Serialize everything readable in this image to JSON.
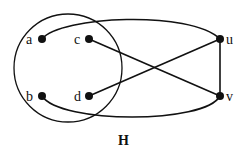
{
  "diagram": {
    "type": "graph",
    "title": "H",
    "colors": {
      "stroke": "#111111",
      "background": "#ffffff"
    },
    "subset_circle": {
      "contains": [
        "a",
        "b",
        "c",
        "d"
      ]
    },
    "vertices": [
      {
        "id": "a",
        "label": "a"
      },
      {
        "id": "b",
        "label": "b"
      },
      {
        "id": "c",
        "label": "c"
      },
      {
        "id": "d",
        "label": "d"
      },
      {
        "id": "u",
        "label": "u"
      },
      {
        "id": "v",
        "label": "v"
      }
    ],
    "edges": [
      {
        "from": "a",
        "to": "u",
        "style": "curved"
      },
      {
        "from": "b",
        "to": "v",
        "style": "curved"
      },
      {
        "from": "c",
        "to": "v",
        "style": "straight"
      },
      {
        "from": "d",
        "to": "u",
        "style": "straight"
      },
      {
        "from": "u",
        "to": "v",
        "style": "straight"
      }
    ]
  }
}
